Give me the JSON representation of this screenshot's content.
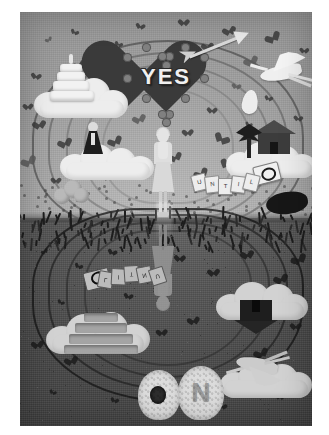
{
  "artwork": {
    "title": "YES",
    "medium": "paper-craft diorama photograph",
    "palette": "grayscale",
    "heart_word": "YES",
    "reflection_word": "ON",
    "horizon_label": "horizon",
    "colors": {
      "sky": "#b0b0b0",
      "ground": "#4a4a4a",
      "paper_white": "#ededed",
      "paper_dark": "#2a2a2a",
      "heart_fill": "#3a3a3a",
      "frame": "#ffffff"
    }
  },
  "upper_scene": {
    "name": "sky-scene",
    "yes_heart": {
      "label": "YES",
      "scallop_count": 14
    },
    "arrow": {
      "label": "cupid-arrow"
    },
    "cake": {
      "label": "wedding-cake",
      "tiers": 4
    },
    "groom": {
      "label": "groom-on-cloud"
    },
    "stork": {
      "label": "stork-in-flight"
    },
    "bundle": {
      "label": "baby-bundle"
    },
    "house": {
      "label": "house-on-cloud"
    },
    "tree": {
      "label": "tree"
    },
    "woman": {
      "label": "bride-figure"
    },
    "banner": {
      "label": "card-banner",
      "cards": [
        "U",
        "N",
        "T",
        "I",
        "L"
      ],
      "ring_card": "ring"
    },
    "bush": {
      "label": "bush"
    }
  },
  "lower_scene": {
    "name": "reflection-scene",
    "no_letters": {
      "o": "O",
      "n": "N"
    },
    "banner_inv": {
      "label": "card-banner-reflection",
      "cards": [
        "L",
        "I",
        "T",
        "N",
        "U"
      ],
      "ring_card": "ring"
    },
    "cake_inv": {
      "label": "wedding-cake-reflection"
    },
    "house_inv": {
      "label": "house-reflection"
    },
    "stork_inv": {
      "label": "stork-reflection"
    },
    "woman_inv": {
      "label": "bride-reflection"
    },
    "dark_blob": {
      "label": "dark-form"
    }
  },
  "confetti": {
    "label": "heart-confetti",
    "sky_positions": [
      [
        26,
        24
      ],
      [
        52,
        18
      ],
      [
        76,
        40
      ],
      [
        14,
        62
      ],
      [
        40,
        78
      ],
      [
        64,
        96
      ],
      [
        18,
        110
      ],
      [
        44,
        128
      ],
      [
        8,
        146
      ],
      [
        70,
        150
      ],
      [
        96,
        30
      ],
      [
        118,
        12
      ],
      [
        140,
        44
      ],
      [
        162,
        8
      ],
      [
        186,
        32
      ],
      [
        208,
        16
      ],
      [
        230,
        46
      ],
      [
        252,
        22
      ],
      [
        272,
        58
      ],
      [
        246,
        84
      ],
      [
        214,
        72
      ],
      [
        190,
        96
      ],
      [
        166,
        118
      ],
      [
        142,
        84
      ],
      [
        118,
        104
      ],
      [
        94,
        126
      ],
      [
        200,
        126
      ],
      [
        226,
        110
      ],
      [
        258,
        132
      ],
      [
        276,
        104
      ],
      [
        34,
        166
      ],
      [
        86,
        162
      ],
      [
        122,
        150
      ],
      [
        154,
        142
      ],
      [
        180,
        158
      ],
      [
        206,
        152
      ],
      [
        240,
        160
      ],
      [
        266,
        148
      ],
      [
        282,
        36
      ],
      [
        6,
        92
      ],
      [
        100,
        70
      ],
      [
        130,
        62
      ],
      [
        58,
        50
      ]
    ],
    "ground_positions": [
      [
        22,
        236
      ],
      [
        56,
        252
      ],
      [
        90,
        238
      ],
      [
        124,
        266
      ],
      [
        158,
        244
      ],
      [
        192,
        258
      ],
      [
        226,
        240
      ],
      [
        260,
        264
      ],
      [
        278,
        244
      ],
      [
        38,
        288
      ],
      [
        72,
        302
      ],
      [
        106,
        282
      ],
      [
        248,
        296
      ],
      [
        274,
        312
      ],
      [
        16,
        330
      ],
      [
        50,
        346
      ],
      [
        240,
        338
      ],
      [
        268,
        360
      ],
      [
        30,
        378
      ],
      [
        92,
        386
      ],
      [
        200,
        392
      ],
      [
        258,
        382
      ],
      [
        140,
        318
      ],
      [
        172,
        306
      ]
    ]
  }
}
